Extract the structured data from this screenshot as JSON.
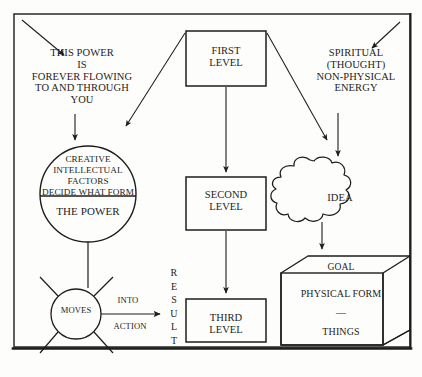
{
  "diagram": {
    "background_color": "#fdfdfb",
    "ink_color": "#1d1d1d",
    "border": {
      "name": "outer-frame"
    },
    "left_column": {
      "heading": "THIS POWER\nIS\nFOREVER FLOWING\nTO AND THROUGH\nYOU",
      "circle_top_label": "CREATIVE\nINTELLECTUAL\nFACTORS\nDECIDE WHAT FORM",
      "circle_bottom_label": "THE POWER",
      "moves_label": "MOVES",
      "into_label": "INTO",
      "action_label": "ACTION"
    },
    "center_column": {
      "first_level": "FIRST\nLEVEL",
      "second_level": "SECOND\nLEVEL",
      "third_level": "THIRD\nLEVEL",
      "result_label": "R\nE\nS\nU\nL\nT"
    },
    "right_column": {
      "heading": "SPIRITUAL\n(THOUGHT)\nNON-PHYSICAL\nENERGY",
      "idea_label": "IDEA",
      "goal_label": "GOAL",
      "physical_form_label": "PHYSICAL FORM",
      "separator_label": "—",
      "things_label": "THINGS"
    }
  }
}
